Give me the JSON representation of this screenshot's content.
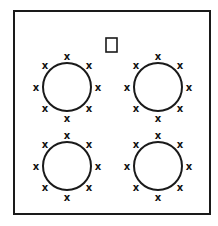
{
  "diagram": {
    "title": "",
    "colors": {
      "stroke": "#1a1a1a",
      "background": "#ffffff"
    },
    "frame": {
      "x": 14,
      "y": 11,
      "width": 196,
      "height": 203
    },
    "marker_square": {
      "x": 106,
      "y": 38,
      "width": 11,
      "height": 14
    },
    "mark_glyph": "x",
    "tables": [
      {
        "id": "table-top-left",
        "cx": 67,
        "cy": 87,
        "r": 24,
        "seats": 8
      },
      {
        "id": "table-top-right",
        "cx": 158,
        "cy": 87,
        "r": 24,
        "seats": 8
      },
      {
        "id": "table-bottom-left",
        "cx": 67,
        "cy": 166,
        "r": 24,
        "seats": 8
      },
      {
        "id": "table-bottom-right",
        "cx": 158,
        "cy": 166,
        "r": 24,
        "seats": 8
      }
    ],
    "seat_radius": 31
  }
}
